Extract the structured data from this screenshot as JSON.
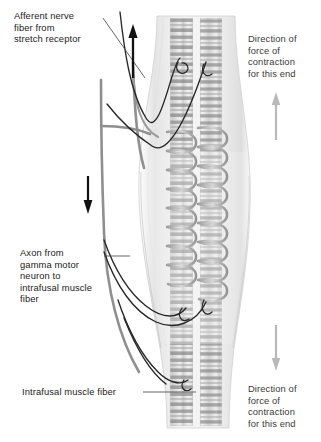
{
  "figure": {
    "background_color": "#ffffff"
  },
  "labels": {
    "afferent": {
      "name": "afferent-nerve-label",
      "lines": [
        "Afferent nerve",
        "fiber from",
        "stretch receptor"
      ],
      "text": "Afferent nerve\nfiber from\nstretch receptor",
      "x": 14,
      "y": 10
    },
    "axon": {
      "name": "gamma-axon-label",
      "lines": [
        "Axon from",
        "gamma motor",
        "neuron to",
        "intrafusal muscle",
        "fiber"
      ],
      "text": "Axon from\ngamma motor\nneuron to\nintrafusal muscle\nfiber",
      "x": 20,
      "y": 247
    },
    "intrafusal": {
      "name": "intrafusal-fiber-label",
      "lines": [
        "Intrafusal muscle fiber"
      ],
      "text": "Intrafusal muscle fiber",
      "x": 22,
      "y": 386
    },
    "direction_top": {
      "name": "direction-top-label",
      "lines": [
        "Direction of",
        "force of",
        "contraction",
        "for this end"
      ],
      "text": "Direction of\nforce of\ncontraction\nfor this end",
      "x": 248,
      "y": 33
    },
    "direction_bottom": {
      "name": "direction-bottom-label",
      "lines": [
        "Direction of",
        "force of",
        "contraction",
        "for this end"
      ],
      "text": "Direction of\nforce of\ncontraction\nfor this end",
      "x": 248,
      "y": 383
    }
  },
  "arrows": [
    {
      "name": "afferent-signal-arrow",
      "direction": "up",
      "color": "#111111",
      "x": 133,
      "y_top": 25,
      "y_bottom": 78
    },
    {
      "name": "efferent-signal-arrow",
      "direction": "down",
      "color": "#111111",
      "x": 88,
      "y_top": 176,
      "y_bottom": 213
    },
    {
      "name": "contraction-force-arrow-top",
      "direction": "up",
      "color": "#b9b9b9",
      "x": 276,
      "y_top": 93,
      "y_bottom": 140
    },
    {
      "name": "contraction-force-arrow-bottom",
      "direction": "down",
      "color": "#b9b9b9",
      "x": 276,
      "y_top": 325,
      "y_bottom": 371
    }
  ],
  "anatomy": {
    "capsule": {
      "name": "spindle-capsule",
      "fill": "#f0f0f0",
      "stroke": "#cfcfcf",
      "description": "translucent fusiform connective tissue capsule"
    },
    "intrafusal_fibers": [
      {
        "name": "intrafusal-fiber-left",
        "x_left": 170,
        "x_right": 193,
        "striations": true
      },
      {
        "name": "intrafusal-fiber-right",
        "x_left": 200,
        "x_right": 222,
        "striations": true
      }
    ],
    "annulospiral_endings": {
      "name": "annulospiral-ending",
      "color": "#8a8a8a",
      "region": "equatorial",
      "y_top": 128,
      "y_bottom": 290
    },
    "gamma_axons": {
      "name": "gamma-motor-axon",
      "color": "#2a2a2a",
      "count": 4
    },
    "afferent_trunk": {
      "name": "afferent-nerve-trunk",
      "color": "#8f8f8f"
    }
  },
  "colors": {
    "text": "#1b1b1b",
    "text_right": "#3a3a3a",
    "leader": "#4a4a4a",
    "black_arrow": "#111111",
    "gray_arrow": "#b9b9b9",
    "fiber_dark": "#7d7d7d",
    "fiber_light": "#e4e4e4"
  }
}
